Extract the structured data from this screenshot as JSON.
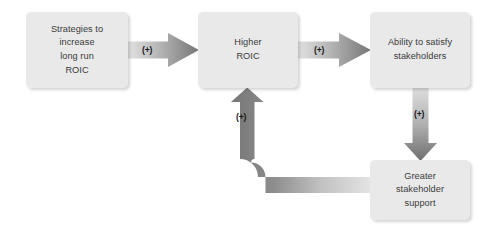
{
  "diagram": {
    "colors": {
      "node_fill": "#e9e9e9",
      "node_text": "#3a3a3a",
      "arrow_dark": "#7c7c7c",
      "arrow_light": "#dcdcdc",
      "background": "#ffffff",
      "label_text": "#1a1a1a"
    },
    "nodes": [
      {
        "id": "strategies",
        "label": "Strategies to\nincrease\nlong run\nROIC"
      },
      {
        "id": "higher-roic",
        "label": "Higher\nROIC"
      },
      {
        "id": "ability",
        "label": "Ability to satisfy\nstakeholders"
      },
      {
        "id": "support",
        "label": "Greater\nstakeholder\nsupport"
      }
    ],
    "connectors": [
      {
        "id": "strategies-to-higher-roic",
        "label": "(+)",
        "direction": "right"
      },
      {
        "id": "higher-roic-to-ability",
        "label": "(+)",
        "direction": "right"
      },
      {
        "id": "ability-to-support",
        "label": "(+)",
        "direction": "down"
      },
      {
        "id": "support-to-higher-roic",
        "label": "(+)",
        "direction": "up"
      }
    ]
  }
}
